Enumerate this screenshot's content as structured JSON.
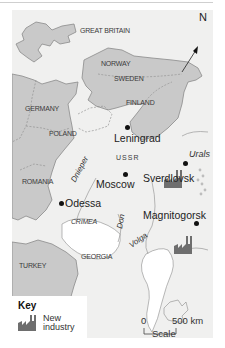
{
  "map": {
    "north_label": "N",
    "countries": {
      "great_britain": "GREAT BRITAIN",
      "norway": "NORWAY",
      "sweden": "SWEDEN",
      "finland": "FINLAND",
      "germany": "GERMANY",
      "poland": "POLAND",
      "romania": "ROMANIA",
      "ussr": "USSR",
      "crimea": "CRIMEA",
      "georgia": "GEORGIA",
      "turkey": "TURKEY"
    },
    "cities": {
      "leningrad": "Leningrad",
      "moscow": "Moscow",
      "odessa": "Odessa",
      "sverdlovsk": "Sverdlovsk",
      "magnitogorsk": "Magnitogorsk"
    },
    "rivers": {
      "dnieper": "Dnieper",
      "don": "Don",
      "volga": "Volga"
    },
    "mountains": {
      "urals": "Urals"
    },
    "colors": {
      "land_foreign": "#c9c9c9",
      "land_ussr": "#f0f0ef",
      "border": "#888888",
      "industry_icon": "#6e6e6e"
    }
  },
  "key": {
    "title": "Key",
    "items": [
      {
        "icon": "factory-icon",
        "label_line1": "New",
        "label_line2": "industry"
      }
    ]
  },
  "scale": {
    "start": "0",
    "end": "500 km",
    "label": "Scale"
  }
}
